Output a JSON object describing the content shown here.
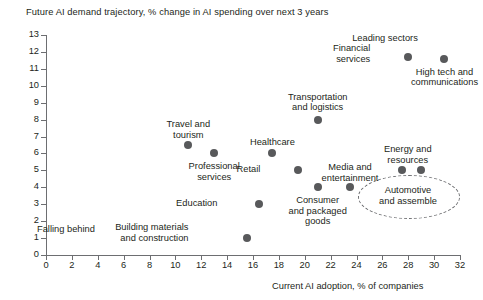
{
  "chart_data": {
    "type": "scatter",
    "title": "Future AI demand trajectory, % change in AI spending over next 3 years",
    "xlabel": "Current AI adoption, % of companies",
    "ylabel": "",
    "xlim": [
      0,
      32
    ],
    "ylim": [
      0,
      13
    ],
    "xticks": [
      0,
      2,
      4,
      6,
      8,
      10,
      12,
      14,
      16,
      18,
      20,
      22,
      24,
      26,
      28,
      30,
      32
    ],
    "yticks": [
      0,
      1,
      2,
      3,
      4,
      5,
      6,
      7,
      8,
      9,
      10,
      11,
      12,
      13
    ],
    "grid": false,
    "legend": "none",
    "point_color": "#58595b",
    "points": [
      {
        "label": "Travel and\ntourism",
        "x": 11.0,
        "y": 6.5
      },
      {
        "label": "Professional\nservices",
        "x": 13.0,
        "y": 6.0
      },
      {
        "label": "Building materials\nand construction",
        "x": 15.5,
        "y": 1.0
      },
      {
        "label": "Education",
        "x": 16.5,
        "y": 3.0
      },
      {
        "label": "Healthcare",
        "x": 17.5,
        "y": 6.0
      },
      {
        "label": "Retail",
        "x": 19.5,
        "y": 5.0
      },
      {
        "label": "Transportation\nand logistics",
        "x": 21.0,
        "y": 8.0
      },
      {
        "label": "Consumer\nand packaged\ngoods",
        "x": 21.0,
        "y": 4.0
      },
      {
        "label": "Media and\nentertainment",
        "x": 23.5,
        "y": 4.0
      },
      {
        "label": "Energy and\nresources",
        "x": 27.5,
        "y": 5.0
      },
      {
        "label": "Automotive\nand assemble",
        "x": 29.0,
        "y": 5.0
      },
      {
        "label": "Financial\nservices",
        "x": 28.0,
        "y": 11.7
      },
      {
        "label": "High tech and\ncommunications",
        "x": 30.8,
        "y": 11.6
      }
    ],
    "annotations": [
      {
        "name": "leading-sectors",
        "text": "Leading sectors"
      },
      {
        "name": "falling-behind",
        "text": "Falling behind"
      },
      {
        "name": "highlight-ellipse",
        "text": "Automotive\nand assemble"
      }
    ]
  },
  "labels": {
    "travel": "Travel and\ntourism",
    "professional": "Professional\nservices",
    "building": "Building materials\nand construction",
    "education": "Education",
    "healthcare": "Healthcare",
    "retail": "Retail",
    "transportation": "Transportation\nand logistics",
    "consumer": "Consumer\nand packaged\ngoods",
    "media": "Media and\nentertainment",
    "energy": "Energy and\nresources",
    "automotive": "Automotive\nand assemble",
    "financial": "Financial\nservices",
    "hightech": "High tech and\ncommunications",
    "leading_sectors": "Leading sectors",
    "falling_behind": "Falling behind"
  },
  "axis": {
    "x_title": "Current AI adoption, % of companies",
    "x_ticks": [
      "0",
      "2",
      "4",
      "6",
      "8",
      "10",
      "12",
      "14",
      "16",
      "18",
      "20",
      "22",
      "24",
      "26",
      "28",
      "30",
      "32"
    ],
    "y_ticks": [
      "0",
      "1",
      "2",
      "3",
      "4",
      "5",
      "6",
      "7",
      "8",
      "9",
      "10",
      "11",
      "12",
      "13"
    ]
  }
}
